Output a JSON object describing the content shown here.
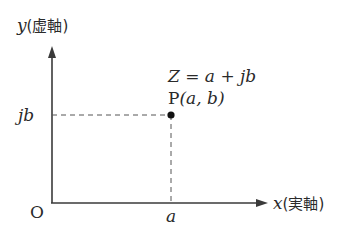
{
  "diagram": {
    "type": "complex-plane",
    "y_axis": {
      "var": "y",
      "label": "(虚軸)"
    },
    "x_axis": {
      "var": "x",
      "label": "(実軸)"
    },
    "origin": "O",
    "point": {
      "name": "P",
      "coords": "(a, b)",
      "equation": "Z = a + jb"
    },
    "tick_x": "a",
    "tick_y": "jb",
    "colors": {
      "line": "#3a3a3a",
      "dash": "#555555",
      "point": "#111111"
    }
  }
}
